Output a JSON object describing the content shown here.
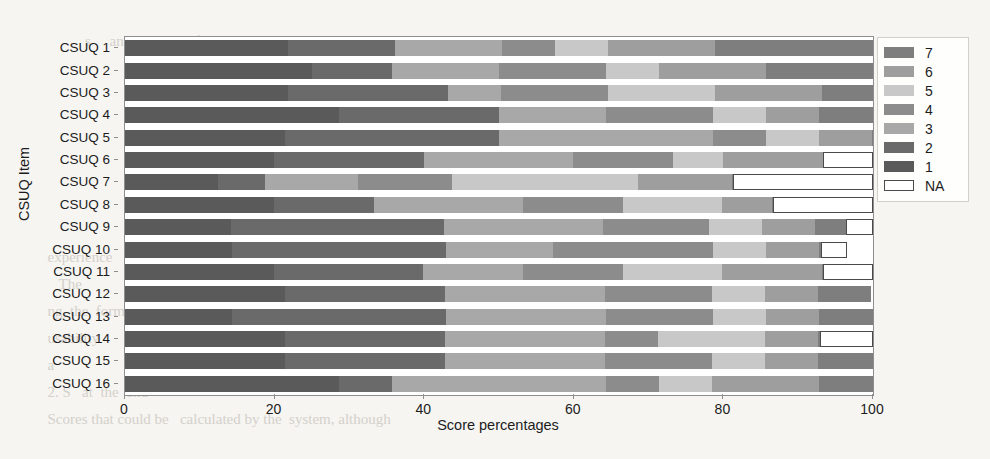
{
  "page": {
    "background_texture_lines": [
      "            s     and scores    of usability scales.   The",
      "                                                              nt",
      "                                                              d",
      "                                                              y",
      "                                                              ",
      "                                                              ",
      "                                                              ",
      "                                                              ",
      "  experience                                                  ",
      "     The                                                      ",
      "  ng, the  form   was considered                              ",
      "  usability                                                   ",
      "  a                                                           ",
      "  2. S   at  the  end                                         ",
      "  Scores that could be   calculated by the  system, although"
    ]
  },
  "chart_data": {
    "type": "bar",
    "orientation": "horizontal",
    "stacked": true,
    "stack_mode": "percent",
    "title": "",
    "xlabel": "Score percentages",
    "ylabel": "CSUQ Item",
    "xlim": [
      0,
      100
    ],
    "xticks": [
      0,
      20,
      40,
      60,
      80,
      100
    ],
    "grid": false,
    "legend_position": "upper right outside",
    "legend_title": "",
    "series_order_in_stack": [
      "1",
      "2",
      "3",
      "4",
      "5",
      "6",
      "7",
      "NA"
    ],
    "legend_entries": [
      {
        "label": "7",
        "color": "#7e7e7e"
      },
      {
        "label": "6",
        "color": "#9e9e9e"
      },
      {
        "label": "5",
        "color": "#c8c8c8"
      },
      {
        "label": "4",
        "color": "#8c8c8c"
      },
      {
        "label": "3",
        "color": "#a8a8a8"
      },
      {
        "label": "2",
        "color": "#6a6a6a"
      },
      {
        "label": "1",
        "color": "#5a5a5a"
      },
      {
        "label": "NA",
        "color": "#ffffff"
      }
    ],
    "colors": {
      "7": "#7e7e7e",
      "6": "#9e9e9e",
      "5": "#c8c8c8",
      "4": "#8c8c8c",
      "3": "#a8a8a8",
      "2": "#6a6a6a",
      "1": "#5a5a5a",
      "NA": "#ffffff"
    },
    "categories": [
      "CSUQ 1",
      "CSUQ 2",
      "CSUQ 3",
      "CSUQ 4",
      "CSUQ 5",
      "CSUQ 6",
      "CSUQ 7",
      "CSUQ 8",
      "CSUQ 9",
      "CSUQ 10",
      "CSUQ 11",
      "CSUQ 12",
      "CSUQ 13",
      "CSUQ 14",
      "CSUQ 15",
      "CSUQ 16"
    ],
    "series": [
      {
        "name": "1",
        "values": [
          21.8,
          25.0,
          21.8,
          28.6,
          21.4,
          21.4,
          14.3,
          21.4,
          14.3,
          14.3,
          21.4,
          21.4,
          14.3,
          21.4,
          21.4,
          28.6
        ]
      },
      {
        "name": "2",
        "values": [
          14.3,
          10.7,
          21.4,
          21.4,
          28.6,
          21.4,
          7.1,
          14.3,
          28.6,
          28.6,
          21.4,
          21.4,
          28.6,
          21.4,
          21.4,
          7.1
        ]
      },
      {
        "name": "3",
        "values": [
          14.3,
          14.3,
          7.1,
          14.3,
          28.6,
          21.4,
          14.3,
          21.4,
          21.4,
          14.3,
          14.3,
          21.4,
          21.4,
          21.4,
          21.4,
          28.6
        ]
      },
      {
        "name": "4",
        "values": [
          7.1,
          14.3,
          14.3,
          14.3,
          7.1,
          14.3,
          14.3,
          14.3,
          14.3,
          21.4,
          14.3,
          14.3,
          14.3,
          7.1,
          14.3,
          7.1
        ]
      },
      {
        "name": "5",
        "values": [
          7.1,
          7.1,
          14.3,
          7.1,
          7.1,
          7.1,
          28.6,
          14.3,
          7.1,
          7.1,
          14.3,
          7.1,
          7.1,
          14.3,
          7.1,
          7.1
        ]
      },
      {
        "name": "6",
        "values": [
          14.3,
          14.3,
          14.3,
          7.1,
          7.1,
          14.3,
          14.3,
          7.1,
          7.1,
          7.1,
          14.3,
          7.1,
          7.1,
          7.1,
          7.1,
          14.3
        ]
      },
      {
        "name": "7",
        "values": [
          21.1,
          14.3,
          6.8,
          7.2,
          0.1,
          0.1,
          0.2,
          0.2,
          4.2,
          0.2,
          0.2,
          7.1,
          7.2,
          0.2,
          7.3,
          7.2
        ]
      },
      {
        "name": "NA",
        "values": [
          0.0,
          0.0,
          0.0,
          0.0,
          0.0,
          7.1,
          21.4,
          14.3,
          3.6,
          3.6,
          7.1,
          0.0,
          0.0,
          7.1,
          0.0,
          0.0
        ]
      }
    ]
  }
}
